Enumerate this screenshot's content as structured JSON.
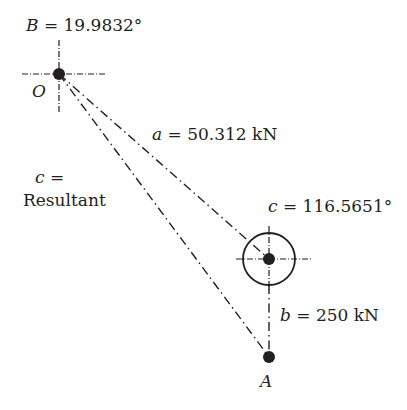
{
  "labels": {
    "angle_B": {
      "symbol": "B",
      "text": " = 19.9832°"
    },
    "point_O": "O",
    "force_a": {
      "symbol": "a",
      "text": " = 50.312 kN"
    },
    "resultant": {
      "symbol": "c",
      "eq": " =",
      "text": "Resultant"
    },
    "angle_c": {
      "symbol": "c",
      "text": " = 116.5651°"
    },
    "force_b": {
      "symbol": "b",
      "text": " = 250 kN"
    },
    "point_A": "A"
  },
  "colors": {
    "ink": "#231f20",
    "background": "#ffffff"
  }
}
